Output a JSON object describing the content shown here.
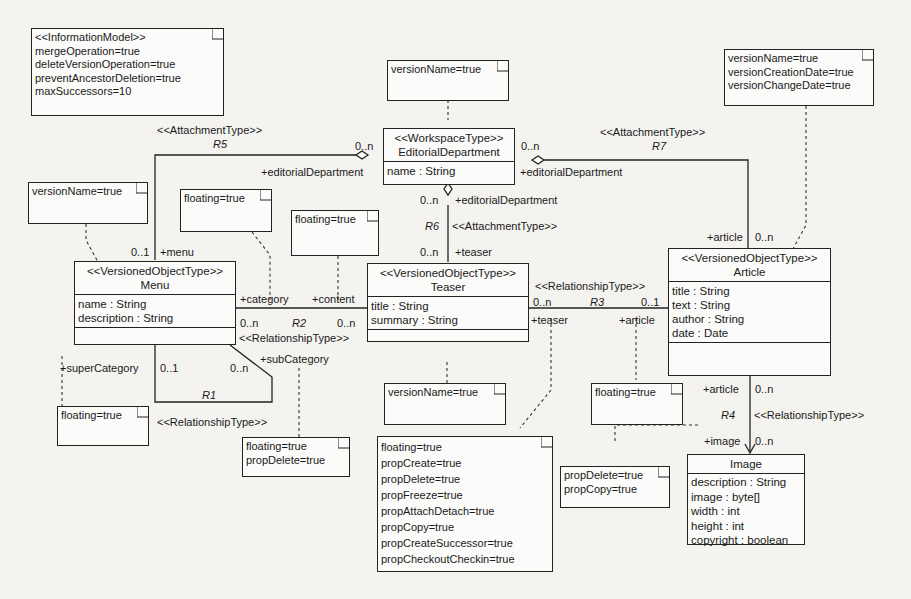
{
  "notes": {
    "info_model": [
      "<<InformationModel>>",
      "mergeOperation=true",
      "deleteVersionOperation=true",
      "preventAncestorDeletion=true",
      "maxSuccessors=10"
    ],
    "workspace_note": [
      "versionName=true"
    ],
    "article_note": [
      "versionName=true",
      "versionCreationDate=true",
      "versionChangeDate=true"
    ],
    "menu_note": [
      "versionName=true"
    ],
    "category_note": [
      "floating=true"
    ],
    "content_note": [
      "floating=true"
    ],
    "supercat_note": [
      "floating=true"
    ],
    "subcat_note": [
      "floating=true",
      "propDelete=true"
    ],
    "teaser_note": [
      "versionName=true"
    ],
    "r3_teaser_note": [
      "floating=true",
      "propCreate=true",
      "propDelete=true",
      "propFreeze=true",
      "propAttachDetach=true",
      "propCopy=true",
      "propCreateSuccessor=true",
      "propCheckoutCheckin=true"
    ],
    "r3_article_note": [
      "floating=true"
    ],
    "r4_image_note": [
      "propDelete=true",
      "propCopy=true"
    ]
  },
  "classes": {
    "editorial": {
      "stereotype": "<<WorkspaceType>>",
      "name": "EditorialDepartment",
      "attrs": [
        "name : String"
      ]
    },
    "menu": {
      "stereotype": "<<VersionedObjectType>>",
      "name": "Menu",
      "attrs": [
        "name : String",
        "description : String"
      ]
    },
    "teaser": {
      "stereotype": "<<VersionedObjectType>>",
      "name": "Teaser",
      "attrs": [
        "title : String",
        "summary : String"
      ]
    },
    "article": {
      "stereotype": "<<VersionedObjectType>>",
      "name": "Article",
      "attrs": [
        "title : String",
        "text : String",
        "author : String",
        "date : Date"
      ]
    },
    "image": {
      "stereotype": "",
      "name": "Image",
      "attrs": [
        "description : String",
        "image : byte[]",
        "width : int",
        "height : int",
        "copyright : boolean"
      ]
    }
  },
  "relations": {
    "r5": {
      "stereotype": "<<AttachmentType>>",
      "name": "R5",
      "ws_mult": "0..n",
      "ws_role": "+editorialDepartment",
      "other_mult": "0..1",
      "other_role": "+menu"
    },
    "r7": {
      "stereotype": "<<AttachmentType>>",
      "name": "R7",
      "ws_mult": "0..n",
      "ws_role": "+editorialDepartment",
      "other_mult": "0..n",
      "other_role": "+article"
    },
    "r6": {
      "stereotype": "<<AttachmentType>>",
      "name": "R6",
      "ws_mult": "0..n",
      "ws_role": "+editorialDepartment",
      "other_mult": "0..n",
      "other_role": "+teaser"
    },
    "r2": {
      "stereotype": "<<RelationshipType>>",
      "name": "R2",
      "left_role": "+category",
      "right_role": "+content",
      "left_mult": "0..n",
      "right_mult": "0..n"
    },
    "r1": {
      "stereotype": "<<RelationshipType>>",
      "name": "R1",
      "left_role": "+superCategory",
      "right_role": "+subCategory",
      "left_mult": "0..1",
      "right_mult": "0..n"
    },
    "r3": {
      "stereotype": "<<RelationshipType>>",
      "name": "R3",
      "left_role": "+teaser",
      "right_role": "+article",
      "left_mult": "0..n",
      "right_mult": "0..1"
    },
    "r4": {
      "stereotype": "<<RelationshipType>>",
      "name": "R4",
      "top_role": "+article",
      "top_mult": "0..n",
      "bottom_role": "+image",
      "bottom_mult": "0..n"
    }
  }
}
